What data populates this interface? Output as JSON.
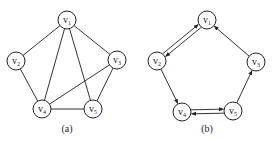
{
  "graphs": [
    {
      "id": "a",
      "caption": "(a)",
      "directed": false,
      "caption_pos": [
        67,
        132
      ],
      "nodes": [
        {
          "id": "v1",
          "label": "v",
          "sub": "1",
          "x": 67,
          "y": 20
        },
        {
          "id": "v2",
          "label": "v",
          "sub": "2",
          "x": 16,
          "y": 61
        },
        {
          "id": "v3",
          "label": "v",
          "sub": "3",
          "x": 117,
          "y": 60
        },
        {
          "id": "v4",
          "label": "v",
          "sub": "4",
          "x": 42,
          "y": 109
        },
        {
          "id": "v5",
          "label": "v",
          "sub": "5",
          "x": 93,
          "y": 109
        }
      ],
      "edges": [
        {
          "from": "v1",
          "to": "v2"
        },
        {
          "from": "v1",
          "to": "v3"
        },
        {
          "from": "v1",
          "to": "v4"
        },
        {
          "from": "v1",
          "to": "v5"
        },
        {
          "from": "v2",
          "to": "v4"
        },
        {
          "from": "v3",
          "to": "v4"
        },
        {
          "from": "v3",
          "to": "v5"
        },
        {
          "from": "v4",
          "to": "v5"
        }
      ]
    },
    {
      "id": "b",
      "caption": "(b)",
      "directed": true,
      "caption_pos": [
        207,
        132
      ],
      "nodes": [
        {
          "id": "v1",
          "label": "v",
          "sub": "1",
          "x": 207,
          "y": 20
        },
        {
          "id": "v2",
          "label": "v",
          "sub": "2",
          "x": 157,
          "y": 61
        },
        {
          "id": "v3",
          "label": "v",
          "sub": "3",
          "x": 256,
          "y": 62
        },
        {
          "id": "v4",
          "label": "v",
          "sub": "4",
          "x": 182,
          "y": 112
        },
        {
          "id": "v5",
          "label": "v",
          "sub": "5",
          "x": 233,
          "y": 111
        }
      ],
      "edges": [
        {
          "from": "v2",
          "to": "v1",
          "offset": -2
        },
        {
          "from": "v1",
          "to": "v2",
          "offset": -2
        },
        {
          "from": "v2",
          "to": "v4",
          "offset": 0
        },
        {
          "from": "v4",
          "to": "v5",
          "offset": -2
        },
        {
          "from": "v5",
          "to": "v4",
          "offset": -2
        },
        {
          "from": "v5",
          "to": "v3",
          "offset": 0
        },
        {
          "from": "v3",
          "to": "v1",
          "offset": 0
        }
      ]
    }
  ],
  "node_radius": 9,
  "colors": {
    "stroke": "#222222",
    "background": "#ffffff"
  }
}
